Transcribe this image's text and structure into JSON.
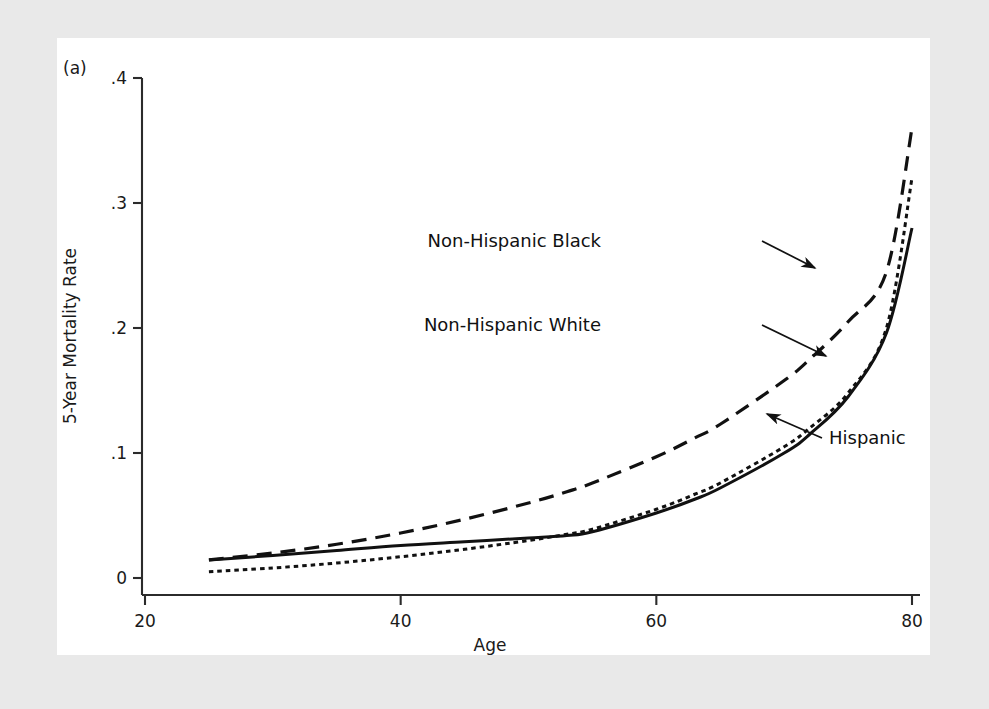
{
  "figure": {
    "panel_label": "(a)",
    "background_color": "#e9e9e9",
    "panel_color": "#ffffff",
    "line_color": "#111111"
  },
  "chart_data": {
    "type": "line",
    "title": "",
    "subtitle": "",
    "xlabel": "Age",
    "ylabel": "5-Year Mortality Rate",
    "xlim": [
      20,
      80
    ],
    "ylim": [
      0,
      0.4
    ],
    "xticks": [
      20,
      40,
      60,
      80
    ],
    "xtick_labels": [
      "20",
      "40",
      "60",
      "80"
    ],
    "yticks": [
      0,
      0.1,
      0.2,
      0.3,
      0.4
    ],
    "ytick_labels": [
      "0",
      ".1",
      ".2",
      ".3",
      ".4"
    ],
    "grid": false,
    "legend": "inline-annotations",
    "x": [
      25,
      30,
      35,
      40,
      45,
      50,
      53,
      55,
      60,
      63,
      65,
      70,
      72,
      75,
      78,
      80
    ],
    "series": [
      {
        "name": "Non-Hispanic Black",
        "style": "long-dash",
        "dasharray": "15 9",
        "width": 3.2,
        "values": [
          0.0145,
          0.02,
          0.027,
          0.036,
          0.047,
          0.06,
          0.069,
          0.076,
          0.097,
          0.112,
          0.123,
          0.158,
          0.175,
          0.205,
          0.245,
          0.36
        ]
      },
      {
        "name": "Non-Hispanic White",
        "style": "short-dash",
        "dasharray": "4.5 4",
        "width": 3.0,
        "values": [
          0.005,
          0.008,
          0.012,
          0.017,
          0.023,
          0.03,
          0.035,
          0.039,
          0.055,
          0.067,
          0.076,
          0.105,
          0.12,
          0.148,
          0.2,
          0.32
        ]
      },
      {
        "name": "Hispanic",
        "style": "solid",
        "dasharray": "",
        "width": 3.0,
        "values": [
          0.0145,
          0.018,
          0.022,
          0.026,
          0.029,
          0.032,
          0.034,
          0.037,
          0.052,
          0.063,
          0.072,
          0.1,
          0.115,
          0.145,
          0.196,
          0.28
        ]
      }
    ],
    "annotations": [
      {
        "label": "Non-Hispanic Black",
        "text_x": 601,
        "text_y": 247,
        "line_start_x": 762,
        "line_start_y": 241,
        "line_end_x": 815,
        "line_end_y": 268
      },
      {
        "label": "Non-Hispanic White",
        "text_x": 601,
        "text_y": 331,
        "line_start_x": 762,
        "line_start_y": 325,
        "line_end_x": 826,
        "line_end_y": 356
      },
      {
        "label": "Hispanic",
        "text_x": 829,
        "text_y": 444,
        "line_start_x": 822,
        "line_start_y": 438,
        "line_end_x": 767,
        "line_end_y": 414
      }
    ]
  }
}
